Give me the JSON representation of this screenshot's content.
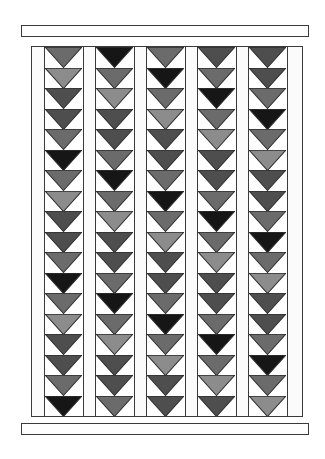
{
  "diagram": {
    "type": "quilt-layout",
    "pattern": "flying geese",
    "columns": 5,
    "rows_per_column": 18,
    "orientation": "pointing-down",
    "palette": {
      "L": "#8c8c8c",
      "M": "#6b6b6b",
      "D": "#4e4e4e",
      "K": "#161616",
      "background": "#ffffff",
      "outline": "#2e2e2e"
    },
    "top_border": {
      "label": ""
    },
    "bottom_border": {
      "label": ""
    },
    "grid": [
      [
        "M",
        "K",
        "M",
        "D",
        "D"
      ],
      [
        "L",
        "M",
        "K",
        "M",
        "D"
      ],
      [
        "D",
        "L",
        "M",
        "K",
        "M"
      ],
      [
        "D",
        "D",
        "L",
        "M",
        "K"
      ],
      [
        "M",
        "D",
        "D",
        "L",
        "M"
      ],
      [
        "K",
        "M",
        "D",
        "D",
        "L"
      ],
      [
        "M",
        "K",
        "M",
        "D",
        "D"
      ],
      [
        "L",
        "M",
        "K",
        "M",
        "D"
      ],
      [
        "D",
        "L",
        "M",
        "K",
        "M"
      ],
      [
        "D",
        "D",
        "L",
        "M",
        "K"
      ],
      [
        "M",
        "D",
        "D",
        "L",
        "M"
      ],
      [
        "K",
        "M",
        "D",
        "D",
        "L"
      ],
      [
        "M",
        "K",
        "M",
        "D",
        "D"
      ],
      [
        "L",
        "M",
        "K",
        "M",
        "D"
      ],
      [
        "D",
        "L",
        "M",
        "K",
        "M"
      ],
      [
        "D",
        "D",
        "L",
        "M",
        "K"
      ],
      [
        "M",
        "D",
        "D",
        "L",
        "M"
      ],
      [
        "K",
        "M",
        "D",
        "D",
        "L"
      ]
    ]
  }
}
